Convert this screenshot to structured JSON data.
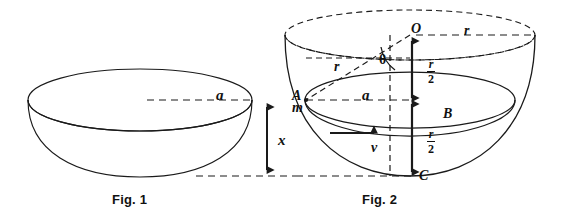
{
  "figure": {
    "title_fig1": "Fig. 1",
    "title_fig2": "Fig. 2",
    "stroke_color": "#1a1a1a",
    "background": "#ffffff"
  },
  "fig1": {
    "caption": "Fig. 1",
    "labels": {
      "radius_a": "a",
      "height_x": "x"
    }
  },
  "fig2": {
    "caption": "Fig. 2",
    "labels": {
      "center_O": "O",
      "point_A": "A",
      "mass_m": "m",
      "point_B": "B",
      "point_C": "C",
      "radius_r_top": "r",
      "radius_r_slant": "r",
      "angle_theta": "θ",
      "radius_a": "a",
      "velocity_v": "v",
      "half_r_numerator_top": "r",
      "half_r_denominator_top": "2",
      "half_r_numerator_bottom": "r",
      "half_r_denominator_bottom": "2"
    }
  }
}
